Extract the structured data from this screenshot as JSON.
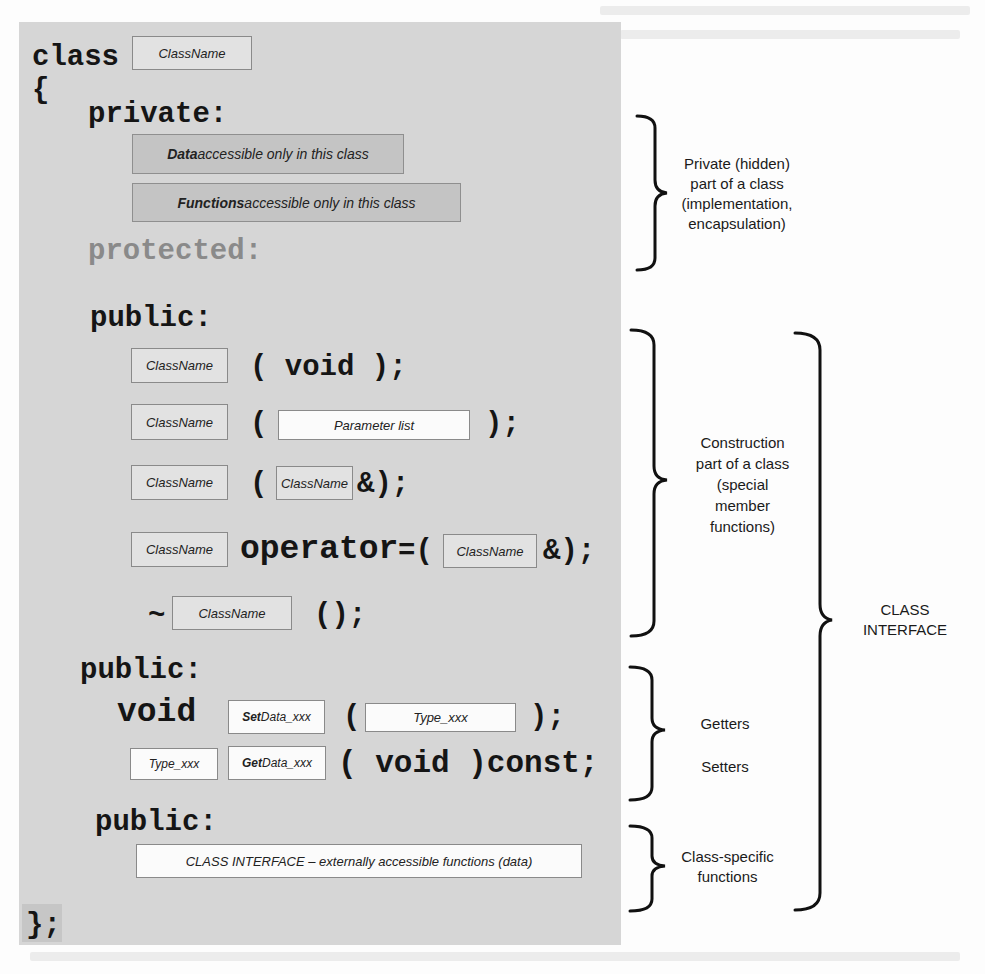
{
  "code": {
    "class_keyword": "class",
    "class_name": "ClassName",
    "open_brace": "{",
    "private_label": "private:",
    "private_data_bold": "Data",
    "private_data_rest": " accessible only in this class",
    "private_functions_bold": "Functions",
    "private_functions_rest": " accessible only in this class",
    "protected_label": "protected:",
    "public_label": "public:",
    "constructors": {
      "default": {
        "name": "ClassName",
        "signature": "( void );"
      },
      "parameterized": {
        "name": "ClassName",
        "open": "(",
        "param": "Parameter list",
        "close": ");"
      },
      "copy": {
        "name": "ClassName",
        "open": "(",
        "param": "ClassName",
        "close": "&);"
      },
      "assignment": {
        "name": "ClassName",
        "operator": "operator",
        "open": "=(",
        "param": "ClassName",
        "close": "&);"
      },
      "destructor": {
        "tilde": "~",
        "name": "ClassName",
        "close": "();"
      }
    },
    "accessors": {
      "public_label": "public:",
      "setter": {
        "return_type": "void",
        "name_bold": "Set",
        "name_rest": "Data_xxx",
        "open": "(",
        "param": "Type_xxx",
        "close": ");"
      },
      "getter": {
        "return_type": "Type_xxx",
        "name_bold": "Get",
        "name_rest": "Data_xxx",
        "signature": "( void )const;"
      }
    },
    "interface": {
      "public_label": "public:",
      "description": "CLASS INTERFACE – externally accessible functions (data)"
    },
    "close_brace": "};"
  },
  "annotations": {
    "private_part": [
      "Private (hidden)",
      "part of a class",
      "(implementation,",
      "encapsulation)"
    ],
    "construction_part": [
      "Construction",
      "part of a class",
      "(special",
      "member",
      "functions)"
    ],
    "getters_setters": [
      "Getters",
      "Setters"
    ],
    "class_specific": [
      "Class-specific",
      "functions"
    ],
    "class_interface": [
      "CLASS",
      "INTERFACE"
    ]
  },
  "colors": {
    "panel": "#d6d6d6",
    "private_box": "#c4c4c4",
    "light_box": "#e2e2e2",
    "white_box": "#fbfbfb",
    "protected_text": "#8a8a8a",
    "ink": "#151515"
  }
}
